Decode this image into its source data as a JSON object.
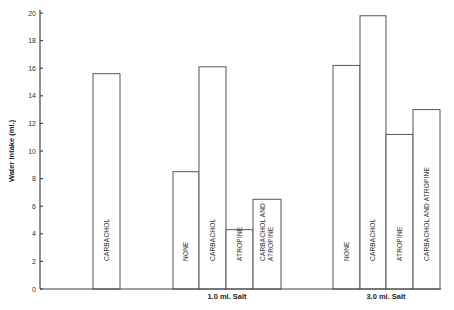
{
  "chart_data": {
    "type": "bar",
    "title": "",
    "xlabel": "",
    "ylabel": "Water Intake (ml.)",
    "ylim": [
      0,
      20
    ],
    "yticks": [
      0,
      2,
      4,
      6,
      8,
      10,
      12,
      14,
      16,
      18,
      20
    ],
    "grid": false,
    "legend": null,
    "groups": [
      {
        "label": "",
        "bars": [
          {
            "label": "CARBACHOL",
            "value": 15.6
          }
        ]
      },
      {
        "label": "1.0 ml. Salt",
        "bars": [
          {
            "label": "NONE",
            "value": 8.5
          },
          {
            "label": "CARBACHOL",
            "value": 16.1
          },
          {
            "label": "ATROPINE",
            "value": 4.3
          },
          {
            "label": "CARBACHOL AND ATROPINE",
            "value": 6.5
          }
        ]
      },
      {
        "label": "3.0 ml. Salt",
        "bars": [
          {
            "label": "NONE",
            "value": 16.2
          },
          {
            "label": "CARBACHOL",
            "value": 19.8
          },
          {
            "label": "ATROPINE",
            "value": 11.2
          },
          {
            "label": "CARBACHOL AND ATROPINE",
            "value": 13.0
          }
        ]
      }
    ]
  },
  "layout": {
    "axis": {
      "x0": 40,
      "y0": 289,
      "ytop": 13,
      "xend": 441
    },
    "bars": [
      {
        "x": 93,
        "w": 27,
        "group": 0,
        "idx": 0,
        "label_lines": [
          "CARBACHOL"
        ]
      },
      {
        "x": 173,
        "w": 26,
        "group": 1,
        "idx": 0,
        "label_lines": [
          "NONE"
        ]
      },
      {
        "x": 199,
        "w": 27,
        "group": 1,
        "idx": 1,
        "label_lines": [
          "CARBACHOL"
        ]
      },
      {
        "x": 226,
        "w": 27,
        "group": 1,
        "idx": 2,
        "label_lines": [
          "ATROPINE"
        ]
      },
      {
        "x": 253,
        "w": 28,
        "group": 1,
        "idx": 3,
        "label_lines": [
          "CARBACHOL AND",
          "ATROPINE"
        ]
      },
      {
        "x": 333,
        "w": 27,
        "group": 2,
        "idx": 0,
        "label_lines": [
          "NONE"
        ]
      },
      {
        "x": 360,
        "w": 26,
        "group": 2,
        "idx": 1,
        "label_lines": [
          "CARBACHOL"
        ]
      },
      {
        "x": 386,
        "w": 27,
        "group": 2,
        "idx": 2,
        "label_lines": [
          "ATROPINE"
        ]
      },
      {
        "x": 413,
        "w": 27,
        "group": 2,
        "idx": 3,
        "label_lines": [
          "CARBACHOL AND ATROPINE"
        ]
      }
    ],
    "group_label_x": [
      null,
      227,
      386
    ]
  }
}
